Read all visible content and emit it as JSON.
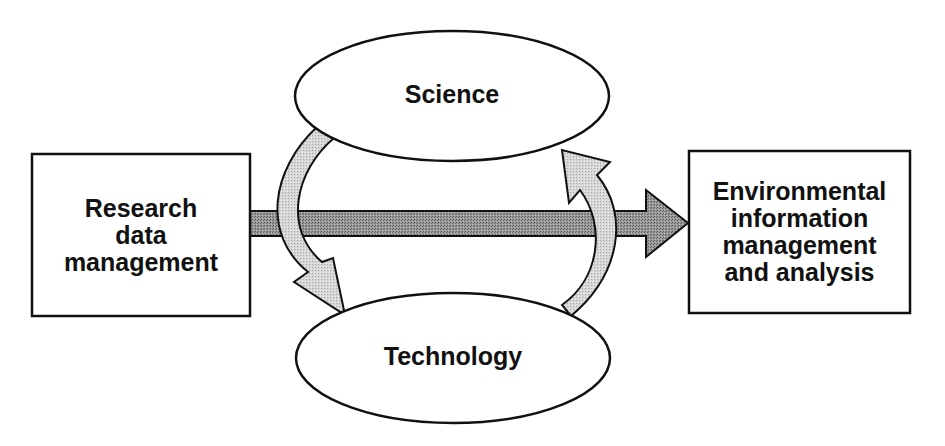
{
  "diagram": {
    "nodes": {
      "left_box": {
        "label": "Research\ndata\nmanagement",
        "shape": "rectangle"
      },
      "science": {
        "label": "Science",
        "shape": "ellipse"
      },
      "technology": {
        "label": "Technology",
        "shape": "ellipse"
      },
      "right_box": {
        "label": "Environmental\ninformation\nmanagement\nand analysis",
        "shape": "rectangle"
      }
    },
    "edges": [
      {
        "from": "Research data management",
        "to": "Environmental information management and analysis",
        "style": "straight-dark-stipple"
      },
      {
        "from": "Science",
        "to": "Technology",
        "style": "curved-light-stipple"
      },
      {
        "from": "Technology",
        "to": "Science",
        "style": "curved-light-stipple"
      }
    ],
    "colors": {
      "stroke": "#111111",
      "main_arrow_fill": "#8c8c8c",
      "cycle_arrow_fill": "#cfcfcf",
      "background": "#ffffff"
    }
  }
}
